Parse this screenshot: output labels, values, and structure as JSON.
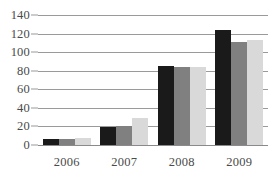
{
  "chart_data": {
    "type": "bar",
    "title": "",
    "subtitle": "",
    "xlabel": "",
    "ylabel": "",
    "categories": [
      "2006",
      "2007",
      "2008",
      "2009"
    ],
    "series": [
      {
        "name": "Series 1",
        "color": "#1a1a1a",
        "values": [
          6,
          19,
          85,
          124
        ]
      },
      {
        "name": "Series 2",
        "color": "#808080",
        "values": [
          7,
          21,
          84,
          111
        ]
      },
      {
        "name": "Series 3",
        "color": "#d9d9d9",
        "values": [
          8,
          29,
          84,
          113
        ]
      }
    ],
    "ylim": [
      0,
      140
    ],
    "ytick_values": [
      0,
      20,
      40,
      60,
      80,
      100,
      120,
      140
    ],
    "ytick_labels": [
      "0",
      "20",
      "40",
      "60",
      "80",
      "100",
      "120",
      "140"
    ],
    "grid": true,
    "grid_axis": "y",
    "legend": false,
    "legend_position": "none",
    "annotations": []
  },
  "axis_style": {
    "grid_color": "#9a9a9a",
    "tick_label_color": "#4a4a4a",
    "background": "#ffffff"
  }
}
